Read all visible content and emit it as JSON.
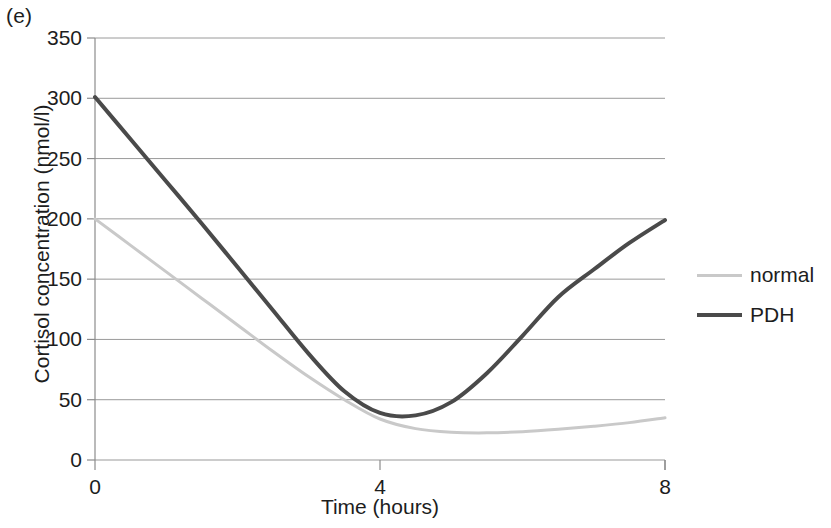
{
  "panel": {
    "label": "(e)"
  },
  "chart_data": {
    "type": "line",
    "title": "",
    "panel_label": "(e)",
    "xlabel": "Time (hours)",
    "ylabel": "Cortisol concentration (nmol/l)",
    "xlim": [
      0,
      8
    ],
    "ylim": [
      0,
      350
    ],
    "xticks": [
      "0",
      "4",
      "8"
    ],
    "xtick_values": [
      0,
      4,
      8
    ],
    "yticks": [
      "0",
      "50",
      "100",
      "150",
      "200",
      "250",
      "300",
      "350"
    ],
    "ytick_values": [
      0,
      50,
      100,
      150,
      200,
      250,
      300,
      350
    ],
    "grid": "horizontal",
    "legend_position": "right",
    "series": [
      {
        "name": "normal",
        "color": "#c9c9c9",
        "x": [
          0,
          0.5,
          1,
          1.5,
          2,
          2.5,
          3,
          3.5,
          4,
          4.5,
          5,
          5.5,
          6,
          6.5,
          7,
          7.5,
          8
        ],
        "values": [
          200,
          178,
          156,
          134,
          112,
          90,
          69,
          50,
          34,
          26,
          23,
          22.5,
          23.5,
          25.5,
          28,
          31,
          35
        ]
      },
      {
        "name": "PDH",
        "color": "#4a4a4a",
        "x": [
          0,
          0.5,
          1,
          1.5,
          2,
          2.5,
          3,
          3.5,
          4,
          4.5,
          5,
          5.5,
          6,
          6.5,
          7,
          7.5,
          8
        ],
        "values": [
          301,
          266,
          231,
          196,
          160,
          124,
          88,
          57,
          39,
          37,
          48,
          72,
          103,
          135,
          158,
          180,
          199
        ]
      }
    ],
    "annotations": {
      "crossover_hours": 3.6,
      "crossover_value": 48,
      "pdh_minimum_value": 37,
      "pdh_minimum_hours": 4.3,
      "normal_minimum_value": 22.5,
      "normal_minimum_hours": 5.5
    },
    "colors": {
      "normal": "#c9c9c9",
      "pdh": "#4a4a4a",
      "grid": "#9a9a9a",
      "axis": "#8c8c8c",
      "text": "#1d1d1d",
      "background": "#ffffff"
    }
  },
  "legend": {
    "items": [
      {
        "label": "normal",
        "swatch": "normal"
      },
      {
        "label": "PDH",
        "swatch": "pdh"
      }
    ]
  }
}
